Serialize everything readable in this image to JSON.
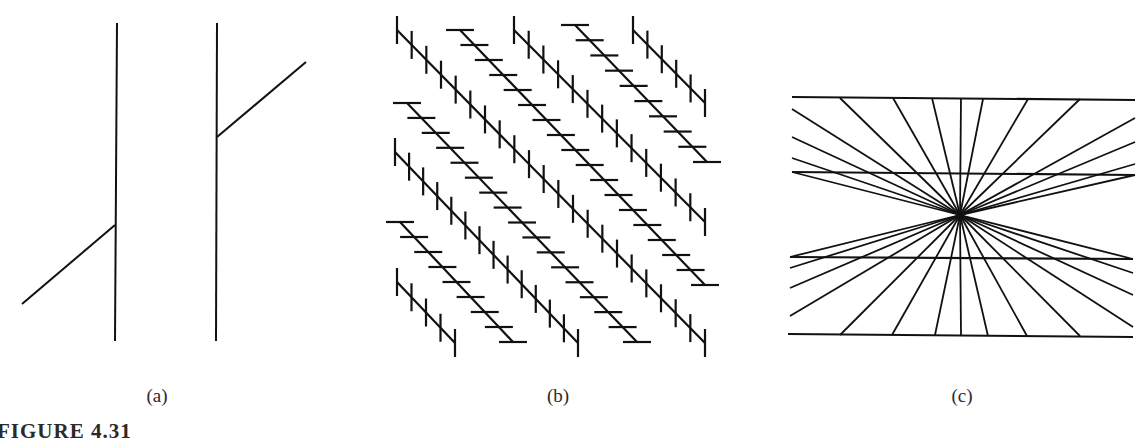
{
  "figure": {
    "caption": "FIGURE 4.31",
    "stroke_color": "#111111",
    "panels": [
      {
        "id": "a",
        "label": "(a)",
        "label_x": 157,
        "description": "Poggendorff illusion: two parallel vertical lines with an oblique line segment interrupted by them",
        "lines": [
          {
            "x1": 117,
            "y1": 23,
            "x2": 115,
            "y2": 341
          },
          {
            "x1": 217,
            "y1": 23,
            "x2": 216,
            "y2": 341
          },
          {
            "x1": 22,
            "y1": 304,
            "x2": 115,
            "y2": 225
          },
          {
            "x1": 217,
            "y1": 137,
            "x2": 306,
            "y2": 62
          }
        ]
      },
      {
        "id": "b",
        "label": "(b)",
        "label_x": 558,
        "description": "Zöllner illusion: parallel diagonal lines crossed by alternating vertical and horizontal short hatch marks",
        "tick_length": 28,
        "tick_spacing_y": 15,
        "diagonals": [
          {
            "tick": "vertical",
            "x1": 397,
            "y1": 30,
            "x2": 705,
            "y2": 343
          },
          {
            "tick": "vertical",
            "x1": 514,
            "y1": 30,
            "x2": 705,
            "y2": 222
          },
          {
            "tick": "vertical",
            "x1": 633,
            "y1": 30,
            "x2": 705,
            "y2": 103
          },
          {
            "tick": "vertical",
            "x1": 395,
            "y1": 152,
            "x2": 578,
            "y2": 343
          },
          {
            "tick": "vertical",
            "x1": 397,
            "y1": 282,
            "x2": 455,
            "y2": 343
          },
          {
            "tick": "horizontal",
            "x1": 460,
            "y1": 30,
            "x2": 705,
            "y2": 285
          },
          {
            "tick": "horizontal",
            "x1": 575,
            "y1": 25,
            "x2": 707,
            "y2": 162
          },
          {
            "tick": "horizontal",
            "x1": 407,
            "y1": 103,
            "x2": 637,
            "y2": 342
          },
          {
            "tick": "horizontal",
            "x1": 400,
            "y1": 222,
            "x2": 513,
            "y2": 342
          }
        ]
      },
      {
        "id": "c",
        "label": "(c)",
        "label_x": 962,
        "description": "Hering illusion: two pairs of parallel horizontal lines over a radial pattern of rays from a central point",
        "center": {
          "x": 960,
          "y": 215
        },
        "horizontal_lines": [
          {
            "x1": 792,
            "y1": 97,
            "x2": 1135,
            "y2": 100
          },
          {
            "x1": 792,
            "y1": 172,
            "x2": 1135,
            "y2": 175
          },
          {
            "x1": 790,
            "y1": 257,
            "x2": 1133,
            "y2": 259
          },
          {
            "x1": 788,
            "y1": 334,
            "x2": 1133,
            "y2": 337
          }
        ],
        "ray_endpoints": [
          {
            "x": 840,
            "y": 98
          },
          {
            "x": 893,
            "y": 98
          },
          {
            "x": 932,
            "y": 98
          },
          {
            "x": 961,
            "y": 98
          },
          {
            "x": 983,
            "y": 99
          },
          {
            "x": 1028,
            "y": 99
          },
          {
            "x": 1080,
            "y": 99
          },
          {
            "x": 792,
            "y": 109
          },
          {
            "x": 792,
            "y": 137
          },
          {
            "x": 792,
            "y": 158
          },
          {
            "x": 792,
            "y": 172
          },
          {
            "x": 1135,
            "y": 118
          },
          {
            "x": 1135,
            "y": 142
          },
          {
            "x": 1135,
            "y": 164
          },
          {
            "x": 1135,
            "y": 175
          },
          {
            "x": 840,
            "y": 335
          },
          {
            "x": 892,
            "y": 335
          },
          {
            "x": 935,
            "y": 335
          },
          {
            "x": 961,
            "y": 335
          },
          {
            "x": 988,
            "y": 336
          },
          {
            "x": 1027,
            "y": 336
          },
          {
            "x": 1080,
            "y": 336
          },
          {
            "x": 790,
            "y": 257
          },
          {
            "x": 790,
            "y": 268
          },
          {
            "x": 790,
            "y": 288
          },
          {
            "x": 790,
            "y": 316
          },
          {
            "x": 1133,
            "y": 259
          },
          {
            "x": 1133,
            "y": 273
          },
          {
            "x": 1133,
            "y": 295
          },
          {
            "x": 1133,
            "y": 327
          }
        ]
      }
    ]
  }
}
